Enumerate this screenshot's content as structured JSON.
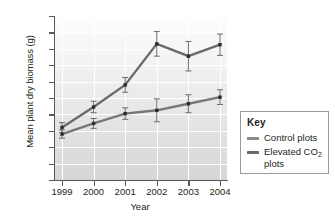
{
  "chart_data": {
    "type": "line",
    "title": "",
    "xlabel": "Year",
    "ylabel": "Mean plant dry biomass (g)",
    "categories": [
      "1999",
      "2000",
      "2001",
      "2002",
      "2003",
      "2004"
    ],
    "x": [
      1999,
      2000,
      2001,
      2002,
      2003,
      2004
    ],
    "xlim": [
      1999,
      2004
    ],
    "ylim": [
      0,
      10
    ],
    "yticks": [
      "0",
      "1",
      "2",
      "3",
      "4",
      "5",
      "6",
      "7",
      "8",
      "9",
      "10"
    ],
    "grid": true,
    "legend_position": "right",
    "series": [
      {
        "name": "Control plots",
        "color": "#777777",
        "values": [
          2.8,
          3.45,
          4.05,
          4.25,
          4.65,
          5.05
        ],
        "error": [
          0.25,
          0.3,
          0.35,
          0.7,
          0.55,
          0.45
        ]
      },
      {
        "name": "Elevated CO2 plots",
        "color": "#6a6a6a",
        "values": [
          3.2,
          4.45,
          5.8,
          8.3,
          7.55,
          8.25
        ],
        "error": [
          0.3,
          0.35,
          0.45,
          0.75,
          0.9,
          0.65
        ]
      }
    ]
  },
  "legend": {
    "title": "Key",
    "items": [
      {
        "label": "Control plots",
        "label_sub": "",
        "label_tail": "",
        "color": "#8a8a8a"
      },
      {
        "label": "Elevated CO",
        "label_sub": "2",
        "label_tail": " plots",
        "color": "#6a6a6a"
      }
    ]
  }
}
